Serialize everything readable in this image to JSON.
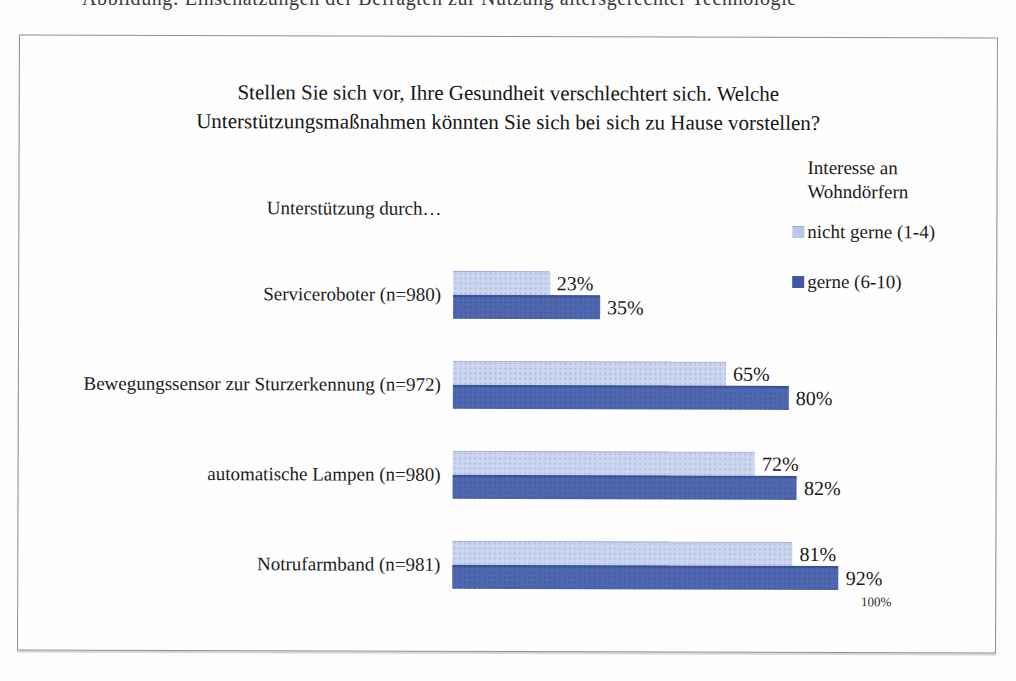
{
  "page": {
    "top_cropped_text": "Abbildung: Einschätzungen der Befragten zur Nutzung altersgerechter Technologie"
  },
  "chart": {
    "title_line1": "Stellen Sie sich vor, Ihre Gesundheit verschlechtert sich. Welche",
    "title_line2": "Unterstützungsmaßnahmen könnten Sie sich bei sich zu Hause vorstellen?",
    "axis_label": "Unterstützung durch…",
    "legend": {
      "title_line1": "Interesse an",
      "title_line2": "Wohndörfern",
      "items": [
        {
          "label": "nicht gerne (1-4)",
          "color": "#b9c7e8"
        },
        {
          "label": "gerne (6-10)",
          "color": "#3f58a8"
        }
      ]
    },
    "x_max_tick": "100%"
  },
  "chart_data": {
    "type": "bar",
    "orientation": "horizontal",
    "title": "Stellen Sie sich vor, Ihre Gesundheit verschlechtert sich. Welche Unterstützungsmaßnahmen könnten Sie sich bei sich zu Hause vorstellen?",
    "axis_label": "Unterstützung durch…",
    "categories": [
      "Serviceroboter (n=980)",
      "Bewegungssensor zur Sturzerkennung (n=972)",
      "automatische Lampen (n=980)",
      "Notrufarmband (n=981)"
    ],
    "series": [
      {
        "name": "nicht gerne (1-4)",
        "color": "#ccd6ee",
        "values": [
          23,
          65,
          72,
          81
        ]
      },
      {
        "name": "gerne (6-10)",
        "color": "#4e67ae",
        "values": [
          35,
          80,
          82,
          92
        ]
      }
    ],
    "xlim": [
      0,
      100
    ],
    "x_ticks_visible": [
      "100%"
    ],
    "legend_title": "Interesse an Wohndörfern",
    "legend_position": "top-right",
    "grid": false,
    "value_labels": "percent-at-bar-end"
  }
}
